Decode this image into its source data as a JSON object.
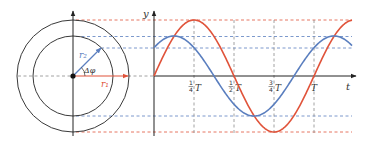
{
  "diagram": {
    "type": "phasor-and-waveform",
    "phasor": {
      "outer_circle_radius_label": "r₁",
      "inner_circle_radius_label": "r₂",
      "angle_label": "Δφ",
      "angle_degrees": 45
    },
    "graph": {
      "y_axis_label": "y",
      "x_axis_label": "t",
      "x_ticks": [
        {
          "num": "1",
          "den": "4",
          "unit": "T"
        },
        {
          "num": "1",
          "den": "2",
          "unit": "T"
        },
        {
          "num": "3",
          "den": "4",
          "unit": "T"
        },
        {
          "num": "",
          "den": "",
          "unit": "T"
        }
      ]
    },
    "series": [
      {
        "name": "r1-wave",
        "color": "#e0533a",
        "amplitude": 56,
        "phase_deg": 0
      },
      {
        "name": "r2-wave",
        "color": "#5b7fbf",
        "amplitude": 40,
        "phase_deg": 45
      }
    ],
    "colors": {
      "red": "#e0533a",
      "blue": "#5b7fbf",
      "axis": "#222222",
      "grid": "#8a8a8a",
      "circle": "#3a3a3a"
    }
  }
}
